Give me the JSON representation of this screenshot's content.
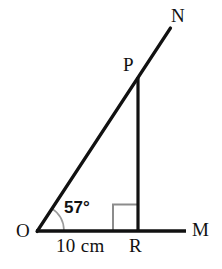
{
  "figure": {
    "type": "geometry-diagram",
    "background_color": "#ffffff",
    "stroke_color": "#111111",
    "marker_color": "#8c8c8c",
    "labels": {
      "origin": "O",
      "ray_end_horizontal": "M",
      "ray_end_diagonal": "N",
      "apex": "P",
      "foot": "R"
    },
    "measurements": {
      "base_length": "10 cm",
      "angle": "57°"
    },
    "points": {
      "O": {
        "x": 37,
        "y": 231
      },
      "M": {
        "x": 186,
        "y": 231
      },
      "R": {
        "x": 138,
        "y": 231
      },
      "P": {
        "x": 138,
        "y": 78
      },
      "N": {
        "x": 170,
        "y": 28
      }
    },
    "angle_arc": {
      "center_x": 37,
      "center_y": 231,
      "radius": 27,
      "start_deg": 0,
      "end_deg": 57
    },
    "right_angle_marker": {
      "x": 113,
      "y": 204,
      "size": 25,
      "at_vertex": "R"
    },
    "segments": [
      {
        "name": "base-line-OM",
        "from": "O",
        "to": "M",
        "width": 3
      },
      {
        "name": "hypotenuse-line-ON",
        "from": "O",
        "to": "N",
        "width": 3
      },
      {
        "name": "vertical-line-PR",
        "from": "P",
        "to": "R",
        "width": 3
      }
    ]
  }
}
